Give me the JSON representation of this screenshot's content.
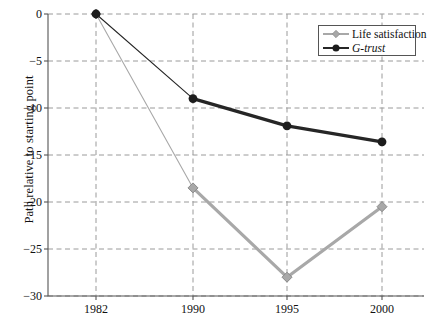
{
  "chart_data": {
    "type": "line",
    "title": "",
    "xlabel": "",
    "ylabel": "Path relative to starting point",
    "categories": [
      "1982",
      "1990",
      "1995",
      "2000"
    ],
    "series": [
      {
        "name": "Life satisfaction",
        "values": [
          0,
          -18.5,
          -28.0,
          -20.5
        ],
        "color": "#a8a8a8",
        "marker": "diamond"
      },
      {
        "name": "G-trust",
        "values": [
          0,
          -9.0,
          -11.9,
          -13.6
        ],
        "color": "#262626",
        "marker": "circle"
      }
    ],
    "ylim": [
      -30,
      0
    ],
    "yticks": [
      0,
      -5,
      -10,
      -15,
      -20,
      -25,
      -30
    ],
    "ytick_labels": [
      "0",
      "−5",
      "−10",
      "−15",
      "−20",
      "−25",
      "−30"
    ],
    "xtick_labels": [
      "1982",
      "1990",
      "1995",
      "2000"
    ],
    "grid": true,
    "grid_style": "dashed",
    "legend_position": "top-right"
  },
  "legend": {
    "items": [
      {
        "label": "Life satisfaction",
        "style": "normal"
      },
      {
        "label": "G-trust",
        "style": "italic"
      }
    ]
  },
  "colors": {
    "life_satisfaction": "#a8a8a8",
    "g_trust": "#262626",
    "grid": "#9a9a9a",
    "frame": "#555555",
    "background": "#ffffff"
  }
}
